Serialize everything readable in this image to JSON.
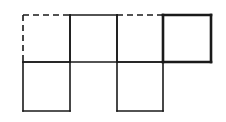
{
  "diagram": {
    "type": "cube-net",
    "stroke_color": "#1a1a1a",
    "background": "#ffffff",
    "grid": {
      "x": [
        23,
        70,
        117,
        163,
        211
      ],
      "y": [
        15,
        62,
        111
      ]
    },
    "squares": [
      {
        "id": "top-1",
        "col": 0,
        "row": 0,
        "dashed_edges": [
          "top",
          "left"
        ],
        "bold": false
      },
      {
        "id": "top-2",
        "col": 1,
        "row": 0,
        "dashed_edges": [],
        "bold": false
      },
      {
        "id": "top-3",
        "col": 2,
        "row": 0,
        "dashed_edges": [
          "top"
        ],
        "bold": false
      },
      {
        "id": "top-4",
        "col": 3,
        "row": 0,
        "dashed_edges": [],
        "bold": true
      },
      {
        "id": "bottom-1",
        "col": 0,
        "row": 1,
        "dashed_edges": [],
        "bold": false
      },
      {
        "id": "bottom-3",
        "col": 2,
        "row": 1,
        "dashed_edges": [],
        "bold": false
      }
    ]
  }
}
